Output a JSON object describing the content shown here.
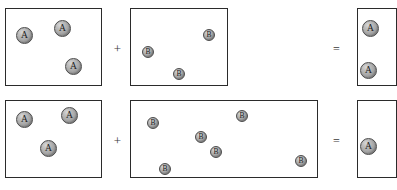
{
  "diagram": {
    "particle_labels": {
      "a": "A",
      "b": "B"
    },
    "operators": {
      "plus": "+",
      "equals": "="
    },
    "colors": {
      "box_border": "#2b2b2b",
      "particle_fill": "#a6a6a6",
      "particle_border": "#4a4a4a",
      "particle_highlight": "#d8d8d8",
      "operator": "#3a3a3a",
      "background": "#ffffff"
    },
    "rows": [
      {
        "name": "top-reaction",
        "reactant_a": {
          "name": "reactant-a-box-top",
          "box": {
            "x": 5,
            "y": 8,
            "w": 97,
            "h": 78
          },
          "particle_type": "a",
          "count": 3,
          "particles": [
            {
              "x": 16,
              "y": 27
            },
            {
              "x": 54,
              "y": 20
            },
            {
              "x": 65,
              "y": 58
            }
          ]
        },
        "operator_plus": {
          "x": 112,
          "y": 42
        },
        "reactant_b": {
          "name": "reactant-b-box-top",
          "box": {
            "x": 130,
            "y": 8,
            "w": 98,
            "h": 78
          },
          "particle_type": "b",
          "count": 3,
          "particles": [
            {
              "x": 203,
              "y": 29
            },
            {
              "x": 142,
              "y": 46
            },
            {
              "x": 173,
              "y": 68
            }
          ]
        },
        "operator_equals": {
          "x": 331,
          "y": 43
        },
        "product": {
          "name": "product-box-top",
          "box": {
            "x": 357,
            "y": 8,
            "w": 40,
            "h": 78
          },
          "particle_type": "a",
          "count": 2,
          "particles": [
            {
              "x": 362,
              "y": 20
            },
            {
              "x": 360,
              "y": 62
            }
          ],
          "clipped": true
        }
      },
      {
        "name": "bottom-reaction",
        "reactant_a": {
          "name": "reactant-a-box-bottom",
          "box": {
            "x": 5,
            "y": 100,
            "w": 97,
            "h": 78
          },
          "particle_type": "a",
          "count": 3,
          "particles": [
            {
              "x": 16,
              "y": 111
            },
            {
              "x": 61,
              "y": 107
            },
            {
              "x": 40,
              "y": 140
            }
          ]
        },
        "operator_plus": {
          "x": 112,
          "y": 134
        },
        "reactant_b": {
          "name": "reactant-b-box-bottom",
          "box": {
            "x": 130,
            "y": 100,
            "w": 188,
            "h": 78
          },
          "particle_type": "b",
          "count": 6,
          "particles": [
            {
              "x": 147,
              "y": 117
            },
            {
              "x": 195,
              "y": 131
            },
            {
              "x": 236,
              "y": 110
            },
            {
              "x": 210,
              "y": 146
            },
            {
              "x": 159,
              "y": 163
            },
            {
              "x": 295,
              "y": 155
            }
          ]
        },
        "operator_equals": {
          "x": 331,
          "y": 135
        },
        "product": {
          "name": "product-box-bottom",
          "box": {
            "x": 357,
            "y": 100,
            "w": 40,
            "h": 78
          },
          "particle_type": "a",
          "count": 1,
          "particles": [
            {
              "x": 360,
              "y": 138
            }
          ],
          "clipped": true
        }
      }
    ]
  }
}
